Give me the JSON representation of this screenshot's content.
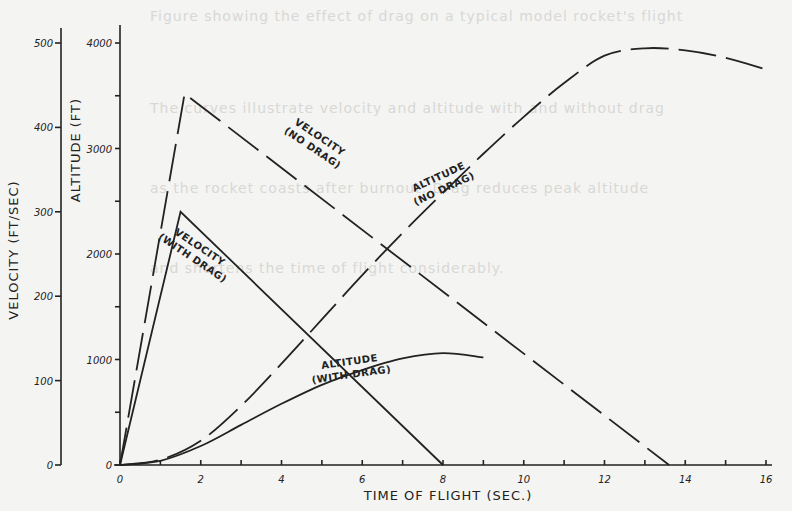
{
  "chart_data": {
    "type": "line",
    "title": "",
    "xlabel": "TIME OF FLIGHT (SEC.)",
    "ylabel_left_outer": "VELOCITY (FT/SEC)",
    "ylabel_left_inner": "ALTITUDE (FT)",
    "xlim": [
      0,
      16
    ],
    "ylim_velocity": [
      0,
      500
    ],
    "ylim_altitude": [
      0,
      4000
    ],
    "x_ticks": [
      0,
      2,
      4,
      6,
      8,
      10,
      12,
      14,
      16
    ],
    "x_tick_labels": [
      "0",
      "2",
      "4",
      "6",
      "8",
      "10",
      "12",
      "14",
      "16"
    ],
    "velocity_ticks": [
      0,
      100,
      200,
      300,
      400,
      500
    ],
    "velocity_tick_labels": [
      "0",
      "100",
      "200",
      "300",
      "400",
      "500"
    ],
    "altitude_ticks": [
      0,
      1000,
      2000,
      3000,
      4000
    ],
    "altitude_tick_labels": [
      "0",
      "1000",
      "2000",
      "3000",
      "4000"
    ],
    "grid": false,
    "legend": "inline curve labels",
    "series": [
      {
        "name": "VELOCITY (NO DRAG)",
        "axis": "velocity",
        "style": "dashed",
        "label_lines": [
          "VELOCITY",
          "(NO DRAG)"
        ],
        "x": [
          0,
          1.6,
          13.6
        ],
        "y": [
          0,
          440,
          0
        ]
      },
      {
        "name": "VELOCITY (WITH DRAG)",
        "axis": "velocity",
        "style": "solid",
        "label_lines": [
          "VELOCITY",
          "(WITH DRAG)"
        ],
        "x": [
          0,
          1.5,
          8.0
        ],
        "y": [
          0,
          300,
          0
        ]
      },
      {
        "name": "ALTITUDE (NO DRAG)",
        "axis": "altitude",
        "style": "dashed",
        "label_lines": [
          "ALTITUDE",
          "(NO DRAG)"
        ],
        "x": [
          0,
          1,
          2,
          3,
          4,
          5,
          6,
          7,
          8,
          9,
          10,
          11,
          12,
          13,
          14,
          15,
          16
        ],
        "y": [
          0,
          50,
          230,
          560,
          960,
          1380,
          1800,
          2200,
          2580,
          2950,
          3300,
          3620,
          3880,
          3950,
          3930,
          3860,
          3750
        ]
      },
      {
        "name": "ALTITUDE (WITH DRAG)",
        "axis": "altitude",
        "style": "solid",
        "label_lines": [
          "ALTITUDE",
          "(WITH DRAG)"
        ],
        "x": [
          0,
          1,
          2,
          3,
          4,
          5,
          6,
          7,
          8,
          9
        ],
        "y": [
          0,
          40,
          180,
          380,
          580,
          760,
          900,
          1010,
          1060,
          1020
        ]
      }
    ]
  },
  "background_text": [
    "Figure showing the effect of drag on a typical model rocket's flight",
    "The curves illustrate velocity and altitude with and without drag",
    "as the rocket coasts after burnout. Drag reduces peak altitude",
    "and shortens the time of flight considerably."
  ]
}
